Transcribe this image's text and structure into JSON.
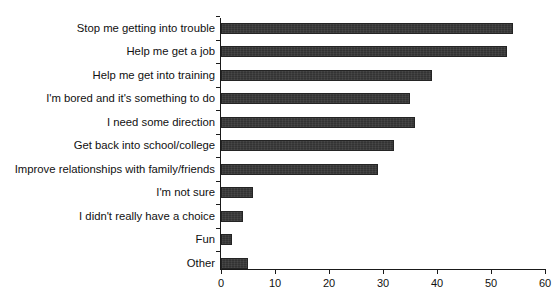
{
  "chart_data": {
    "type": "bar",
    "orientation": "horizontal",
    "title": "",
    "xlabel": "",
    "ylabel": "",
    "xlim": [
      0,
      60
    ],
    "xticks": [
      0,
      10,
      20,
      30,
      40,
      50,
      60
    ],
    "grid": false,
    "legend": null,
    "bar_color": "#333333",
    "categories": [
      "Stop me getting into trouble",
      "Help me get a job",
      "Help me get into training",
      "I'm bored and it's something to do",
      "I need some direction",
      "Get back into school/college",
      "Improve relationships with family/friends",
      "I'm not sure",
      "I didn't really have a choice",
      "Fun",
      "Other"
    ],
    "values": [
      54,
      53,
      39,
      35,
      36,
      32,
      29,
      6,
      4,
      2,
      5
    ]
  }
}
